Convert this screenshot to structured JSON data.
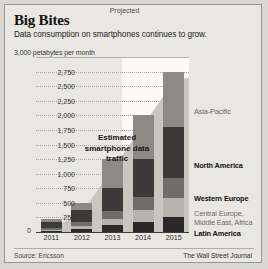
{
  "header": {
    "title": "Big Bites",
    "subtitle": "Data consumption on smartphones continues to grow."
  },
  "axis_note": "3,000 petabytes per month",
  "annotation": "Estimated smartphone data traffic",
  "projected_label": "Projected",
  "zero_label": "0",
  "footer": {
    "source": "Source: Ericsson",
    "brand": "The Wall Street Journal"
  },
  "legend": [
    {
      "label": "Asia-Pacific",
      "color": "#8d8a85",
      "style": "grey"
    },
    {
      "label": "North America",
      "color": "#3b3a38",
      "style": "bold"
    },
    {
      "label": "Western Europe",
      "color": "#6f6d68",
      "style": "bold"
    },
    {
      "label": "Central Europe,\nMiddle East, Africa",
      "color": "#b6b3ad",
      "style": "grey"
    },
    {
      "label": "Latin America",
      "color": "#2a2927",
      "style": "bold"
    }
  ],
  "chart_data": {
    "type": "bar",
    "title": "Big Bites",
    "subtitle": "Data consumption on smartphones continues to grow.",
    "xlabel": "",
    "ylabel": "petabytes per month",
    "ylim": [
      0,
      3000
    ],
    "yticks": [
      0,
      250,
      500,
      750,
      1000,
      1250,
      1500,
      1750,
      2000,
      2250,
      2500,
      2750,
      3000
    ],
    "ytick_labels": [
      "0",
      "250",
      "500",
      "750",
      "1,000",
      "1,250",
      "1,500",
      "1,750",
      "2,000",
      "2,250",
      "2,500",
      "2,750",
      "3,000 petabytes per month"
    ],
    "categories": [
      "2011",
      "2012",
      "2013",
      "2014",
      "2015"
    ],
    "stacked": true,
    "grid": true,
    "legend_position": "right",
    "projected_categories": [
      "2014",
      "2015"
    ],
    "series": [
      {
        "name": "Latin America",
        "color": "#2a2927",
        "values": [
          20,
          60,
          120,
          180,
          260
        ]
      },
      {
        "name": "Central Europe, Middle East, Africa",
        "color": "#b6b3ad",
        "values": [
          20,
          50,
          110,
          200,
          330
        ]
      },
      {
        "name": "Western Europe",
        "color": "#6f6d68",
        "values": [
          35,
          70,
          130,
          220,
          340
        ]
      },
      {
        "name": "North America",
        "color": "#3b3a38",
        "values": [
          95,
          190,
          390,
          650,
          870
        ]
      },
      {
        "name": "Asia-Pacific",
        "color": "#8d8a85",
        "values": [
          60,
          130,
          500,
          750,
          950
        ]
      }
    ],
    "totals": [
      230,
      500,
      1250,
      2000,
      2750
    ]
  }
}
